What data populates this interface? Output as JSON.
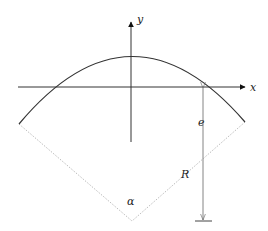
{
  "diagram": {
    "type": "geometry",
    "labels": {
      "x_axis": "x",
      "y_axis": "y",
      "distance": "e",
      "radius": "R",
      "angle": "α"
    },
    "colors": {
      "line": "#333333",
      "dashed": "#aaaaaa",
      "background": "#ffffff"
    }
  }
}
